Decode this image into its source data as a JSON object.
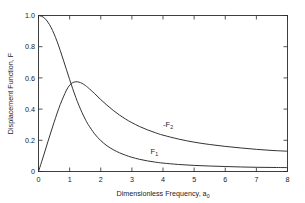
{
  "chart_data": {
    "type": "line",
    "title": "",
    "xlabel": "Dimensionless Frequency, a",
    "xlabel_sub": "0",
    "ylabel": "Displacement Function, F",
    "xlim": [
      0,
      8
    ],
    "ylim": [
      0,
      1.0
    ],
    "grid": false,
    "legend_position": "inline-annotations",
    "xticks": [
      "0",
      "1",
      "2",
      "3",
      "4",
      "5",
      "6",
      "7",
      "8"
    ],
    "xtick_values": [
      0,
      1,
      2,
      3,
      4,
      5,
      6,
      7,
      8
    ],
    "yticks": [
      "0",
      "0.2",
      "0.4",
      "0.6",
      "0.8",
      "1.0"
    ],
    "ytick_values": [
      0,
      0.2,
      0.4,
      0.6,
      0.8,
      1.0
    ],
    "x": [
      0,
      0.1,
      0.2,
      0.3,
      0.4,
      0.5,
      0.6,
      0.7,
      0.8,
      0.9,
      1.0,
      1.1,
      1.2,
      1.3,
      1.4,
      1.5,
      1.6,
      1.8,
      2.0,
      2.2,
      2.4,
      2.6,
      2.8,
      3.0,
      3.25,
      3.5,
      3.75,
      4.0,
      4.5,
      5.0,
      5.5,
      6.0,
      6.5,
      7.0,
      7.5,
      8.0
    ],
    "series": [
      {
        "name": "F1",
        "label": "F₁",
        "label_at_x": 3.6,
        "label_at_y": 0.115,
        "color": "#333333",
        "values": [
          1.0,
          0.995,
          0.982,
          0.958,
          0.925,
          0.882,
          0.832,
          0.775,
          0.714,
          0.652,
          0.59,
          0.53,
          0.474,
          0.423,
          0.377,
          0.336,
          0.3,
          0.242,
          0.198,
          0.165,
          0.14,
          0.12,
          0.104,
          0.091,
          0.078,
          0.068,
          0.06,
          0.054,
          0.045,
          0.039,
          0.035,
          0.032,
          0.029,
          0.027,
          0.026,
          0.025
        ]
      },
      {
        "name": "F2",
        "label": "-F₂",
        "label_at_x": 4.0,
        "label_at_y": 0.285,
        "color": "#333333",
        "values": [
          0.0,
          0.062,
          0.125,
          0.19,
          0.253,
          0.315,
          0.375,
          0.43,
          0.478,
          0.522,
          0.553,
          0.57,
          0.575,
          0.573,
          0.565,
          0.552,
          0.536,
          0.5,
          0.461,
          0.425,
          0.392,
          0.362,
          0.336,
          0.313,
          0.288,
          0.267,
          0.249,
          0.233,
          0.208,
          0.188,
          0.173,
          0.161,
          0.151,
          0.142,
          0.135,
          0.13
        ]
      }
    ]
  }
}
